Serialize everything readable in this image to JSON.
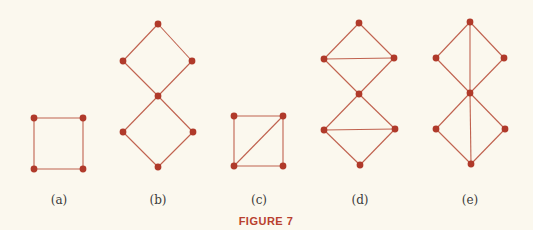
{
  "caption": "FIGURE 7",
  "colors": {
    "background": "#fbf8ee",
    "edge": "#c0624f",
    "node": "#b03a2a",
    "label": "#3a3a3a",
    "caption": "#b8402e"
  },
  "graphs": [
    {
      "id": "a",
      "label": "(a)",
      "label_pos": [
        59,
        204
      ],
      "nodes": [
        [
          34,
          118
        ],
        [
          83,
          118
        ],
        [
          34,
          169
        ],
        [
          83,
          169
        ]
      ],
      "edges": [
        [
          0,
          1
        ],
        [
          1,
          3
        ],
        [
          3,
          2
        ],
        [
          2,
          0
        ]
      ]
    },
    {
      "id": "b",
      "label": "(b)",
      "label_pos": [
        158,
        204
      ],
      "nodes": [
        [
          158,
          24
        ],
        [
          123,
          61
        ],
        [
          192,
          61
        ],
        [
          158,
          96
        ],
        [
          123,
          132
        ],
        [
          193,
          132
        ],
        [
          158,
          167
        ]
      ],
      "edges": [
        [
          0,
          1
        ],
        [
          0,
          2
        ],
        [
          1,
          3
        ],
        [
          2,
          3
        ],
        [
          3,
          4
        ],
        [
          3,
          5
        ],
        [
          4,
          6
        ],
        [
          5,
          6
        ]
      ]
    },
    {
      "id": "c",
      "label": "(c)",
      "label_pos": [
        259,
        204
      ],
      "nodes": [
        [
          234,
          116
        ],
        [
          283,
          116
        ],
        [
          234,
          166
        ],
        [
          283,
          166
        ]
      ],
      "edges": [
        [
          0,
          1
        ],
        [
          1,
          3
        ],
        [
          3,
          2
        ],
        [
          2,
          0
        ],
        [
          2,
          1
        ]
      ]
    },
    {
      "id": "d",
      "label": "(d)",
      "label_pos": [
        360,
        204
      ],
      "nodes": [
        [
          359,
          23
        ],
        [
          324,
          59
        ],
        [
          394,
          58
        ],
        [
          359,
          94
        ],
        [
          324,
          130
        ],
        [
          395,
          129
        ],
        [
          360,
          165
        ]
      ],
      "edges": [
        [
          0,
          1
        ],
        [
          0,
          2
        ],
        [
          1,
          2
        ],
        [
          1,
          3
        ],
        [
          2,
          3
        ],
        [
          3,
          4
        ],
        [
          3,
          5
        ],
        [
          4,
          5
        ],
        [
          4,
          6
        ],
        [
          5,
          6
        ]
      ]
    },
    {
      "id": "e",
      "label": "(e)",
      "label_pos": [
        470,
        204
      ],
      "nodes": [
        [
          470,
          22
        ],
        [
          436,
          58
        ],
        [
          504,
          58
        ],
        [
          470,
          93
        ],
        [
          436,
          129
        ],
        [
          505,
          129
        ],
        [
          471,
          164
        ]
      ],
      "edges": [
        [
          0,
          1
        ],
        [
          0,
          2
        ],
        [
          0,
          3
        ],
        [
          1,
          3
        ],
        [
          2,
          3
        ],
        [
          3,
          4
        ],
        [
          3,
          5
        ],
        [
          3,
          6
        ],
        [
          4,
          6
        ],
        [
          5,
          6
        ]
      ]
    }
  ],
  "caption_pos": [
    266,
    225
  ]
}
